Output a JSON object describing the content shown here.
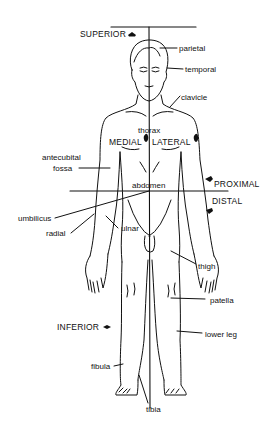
{
  "diagram": {
    "type": "anatomical-position-figure",
    "directional_terms": {
      "superior": "SUPERIOR",
      "inferior": "INFERIOR",
      "medial": "MEDIAL",
      "lateral": "LATERAL",
      "proximal": "PROXIMAL",
      "distal": "DISTAL"
    },
    "body_labels": {
      "parietal": "parietal",
      "temporal": "temporal",
      "clavicle": "clavicle",
      "thorax": "thorax",
      "antecubital_line1": "antecubital",
      "antecubital_line2": "fossa",
      "abdomen": "abdomen",
      "umbilicus": "umbilicus",
      "radial": "radial",
      "ulnar": "ulnar",
      "thigh": "thigh",
      "patella": "patella",
      "lower_leg": "lower leg",
      "fibula": "fibula",
      "tibia": "tibia"
    },
    "colors": {
      "line": "#111111",
      "background": "#ffffff"
    }
  }
}
